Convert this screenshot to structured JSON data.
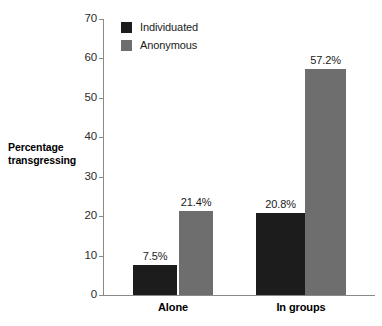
{
  "chart_data": {
    "type": "bar",
    "title": "",
    "subtitle": "",
    "xlabel": "",
    "ylabel": "Percentage transgressing",
    "ylabel_lines": [
      "Percentage",
      "transgressing"
    ],
    "categories": [
      "Alone",
      "In groups"
    ],
    "series": [
      {
        "name": "Individuated",
        "color": "#1c1c1c",
        "values": [
          7.5,
          20.8
        ],
        "labels": [
          "7.5%",
          "20.8%"
        ]
      },
      {
        "name": "Anonymous",
        "color": "#6e6e6e",
        "values": [
          21.4,
          57.2
        ],
        "labels": [
          "21.4%",
          "57.2%"
        ]
      }
    ],
    "ylim": [
      0,
      70
    ],
    "ytick_step": 10,
    "yticks": [
      0,
      10,
      20,
      30,
      40,
      50,
      60,
      70
    ],
    "ytick_labels": [
      "0",
      "10",
      "20",
      "30",
      "40",
      "50",
      "60",
      "70"
    ],
    "grid": false,
    "legend_position": "top-left-inside",
    "legend_entries": [
      "Individuated",
      "Anonymous"
    ],
    "value_labels_shown": true,
    "axis_color": "#8a8a8a",
    "background": "#ffffff"
  }
}
